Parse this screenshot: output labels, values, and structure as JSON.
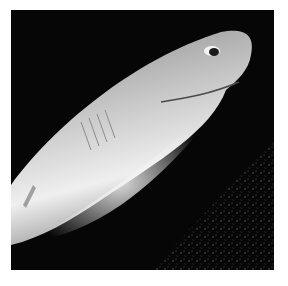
{
  "image": {
    "subject": "shark",
    "description": "Black-and-white underwater photograph of a shark, head at upper right, body extending to lower left against a dark speckled sea floor",
    "colors": {
      "background": "#ffffff",
      "water": "#060606",
      "body_light": "#e6e6e6",
      "body_mid": "#9a9a9a"
    }
  }
}
